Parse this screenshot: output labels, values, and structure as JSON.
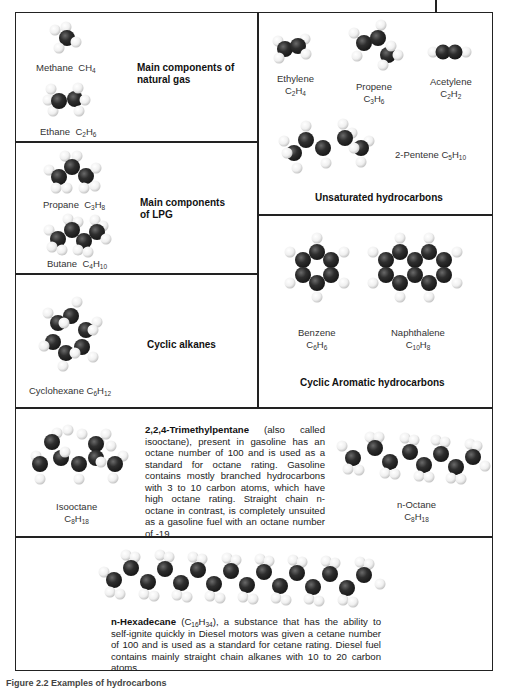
{
  "figure": {
    "caption_partial": "Figure 2.2  Examples of hydrocarbons",
    "colors": {
      "carbon": "#2a2a2a",
      "hydrogen": "#f2f2f2",
      "border": "#222222"
    }
  },
  "panels": {
    "natural_gas": {
      "heading_line1": "Main components of",
      "heading_line2": "natural gas",
      "molecules": [
        {
          "name": "Methane",
          "formula_base": "CH",
          "formula_sub": "4"
        },
        {
          "name": "Ethane",
          "formula_c": "C",
          "c_sub": "2",
          "formula_h": "H",
          "h_sub": "6"
        }
      ]
    },
    "lpg": {
      "heading_line1": "Main components",
      "heading_line2": "of LPG",
      "molecules": [
        {
          "name": "Propane",
          "formula_c": "C",
          "c_sub": "3",
          "formula_h": "H",
          "h_sub": "8"
        },
        {
          "name": "Butane",
          "formula_c": "C",
          "c_sub": "4",
          "formula_h": "H",
          "h_sub": "10"
        }
      ]
    },
    "cyclic_alkanes": {
      "heading": "Cyclic alkanes",
      "molecules": [
        {
          "name": "Cyclohexane",
          "formula_c": "C",
          "c_sub": "6",
          "formula_h": "H",
          "h_sub": "12"
        }
      ]
    },
    "unsaturated": {
      "heading": "Unsaturated hydrocarbons",
      "molecules": [
        {
          "name": "Ethylene",
          "formula_c": "C",
          "c_sub": "2",
          "formula_h": "H",
          "h_sub": "4"
        },
        {
          "name": "Propene",
          "formula_c": "C",
          "c_sub": "3",
          "formula_h": "H",
          "h_sub": "6"
        },
        {
          "name": "Acetylene",
          "formula_c": "C",
          "c_sub": "2",
          "formula_h": "H",
          "h_sub": "2"
        },
        {
          "name": "2-Pentene",
          "formula_c": "C",
          "c_sub": "5",
          "formula_h": "H",
          "h_sub": "10"
        }
      ]
    },
    "aromatic": {
      "heading": "Cyclic Aromatic hydrocarbons",
      "molecules": [
        {
          "name": "Benzene",
          "formula_c": "C",
          "c_sub": "6",
          "formula_h": "H",
          "h_sub": "6"
        },
        {
          "name": "Naphthalene",
          "formula_c": "C",
          "c_sub": "10",
          "formula_h": "H",
          "h_sub": "8"
        }
      ]
    },
    "octane": {
      "title": "2,2,4-Trimethylpentane",
      "text": " (also called isooctane), present in gasoline has an octane number of 100 and is used as a standard for octane rating. Gasoline contains mostly branched hydrocarbons with 3 to 10 carbon atoms, which have high octane rating. Straight chain n-octane in contrast, is completely unsuited as a gasoline fuel with an octane number of -19",
      "molecules": [
        {
          "name": "Isooctane",
          "formula_c": "C",
          "c_sub": "8",
          "formula_h": "H",
          "h_sub": "18"
        },
        {
          "name": "n-Octane",
          "formula_c": "C",
          "c_sub": "8",
          "formula_h": "H",
          "h_sub": "18"
        }
      ]
    },
    "hexadecane": {
      "title": "n-Hexadecane",
      "formula_open": " (C",
      "c_sub": "16",
      "formula_h": "H",
      "h_sub": "34",
      "text": "), a substance that has the ability to self-ignite quickly in Diesel motors was given a cetane number of 100 and is used as a standard for cetane rating. Diesel fuel contains mainly straight chain alkanes with 10 to 20 carbon atoms."
    }
  }
}
